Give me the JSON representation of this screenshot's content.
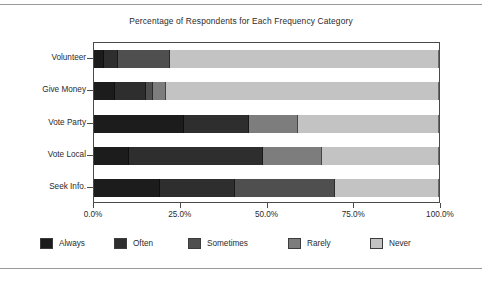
{
  "chart_data": {
    "type": "bar",
    "orientation": "horizontal",
    "stacked": true,
    "normalized_percent": true,
    "title": "Percentage of Respondents for Each Frequency Category",
    "xlabel": "",
    "ylabel": "",
    "xlim": [
      0,
      100
    ],
    "xticks": [
      0,
      25,
      50,
      75,
      100
    ],
    "xticklabels": [
      "0.0%",
      "25.0%",
      "50.0%",
      "75.0%",
      "100.0%"
    ],
    "grid": false,
    "legend_position": "bottom",
    "categories": [
      "Volunteer",
      "Give Money",
      "Vote Party",
      "Vote Local",
      "Seek Info."
    ],
    "series": [
      {
        "name": "Always",
        "color": "#1c1c1c",
        "values": [
          3.0,
          6.0,
          26.0,
          10.0,
          19.0
        ]
      },
      {
        "name": "Often",
        "color": "#2e2e2e",
        "values": [
          4.0,
          9.0,
          19.0,
          39.0,
          22.0
        ]
      },
      {
        "name": "Sometimes",
        "color": "#4f4f4f",
        "values": [
          15.0,
          2.0,
          0.0,
          0.0,
          29.0
        ]
      },
      {
        "name": "Rarely",
        "color": "#7d7d7d",
        "values": [
          0.0,
          4.0,
          14.0,
          17.0,
          0.0
        ]
      },
      {
        "name": "Never",
        "color": "#c3c3c3",
        "values": [
          78.0,
          79.0,
          41.0,
          34.0,
          30.0
        ]
      }
    ]
  }
}
